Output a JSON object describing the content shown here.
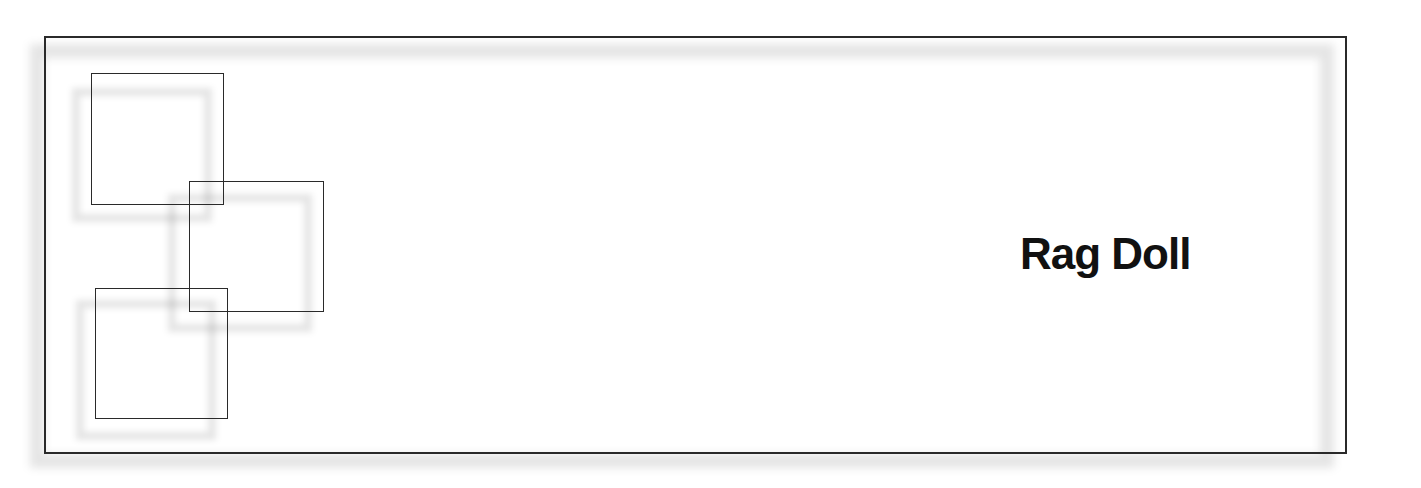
{
  "card": {
    "title": "Rag Doll",
    "colors": {
      "line": "#2a2a2a",
      "text": "#111111",
      "shadow": "#d9d9d9",
      "background": "#ffffff"
    }
  },
  "decor": {
    "squares": [
      {
        "name": "square-top-left"
      },
      {
        "name": "square-middle"
      },
      {
        "name": "square-bottom-left"
      }
    ]
  }
}
